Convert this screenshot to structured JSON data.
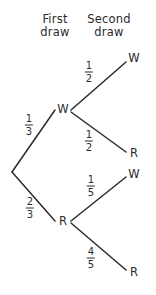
{
  "diagram": {
    "type": "probability-tree",
    "title_columns": [
      {
        "line1": "First",
        "line2": "draw"
      },
      {
        "line1": "Second",
        "line2": "draw"
      }
    ],
    "stroke_color": "#2b2b2b",
    "background_color": "#ffffff",
    "nodes": {
      "first_draw": [
        {
          "label": "W"
        },
        {
          "label": "R"
        }
      ],
      "second_draw": [
        {
          "label": "W"
        },
        {
          "label": "R"
        },
        {
          "label": "W"
        },
        {
          "label": "R"
        }
      ]
    },
    "branches": [
      {
        "from": "root",
        "to": "W",
        "numerator": "1",
        "denominator": "3"
      },
      {
        "from": "root",
        "to": "R",
        "numerator": "2",
        "denominator": "3"
      },
      {
        "from": "W",
        "to": "W",
        "numerator": "1",
        "denominator": "2"
      },
      {
        "from": "W",
        "to": "R",
        "numerator": "1",
        "denominator": "2"
      },
      {
        "from": "R",
        "to": "W",
        "numerator": "1",
        "denominator": "5"
      },
      {
        "from": "R",
        "to": "R",
        "numerator": "4",
        "denominator": "5"
      }
    ]
  }
}
